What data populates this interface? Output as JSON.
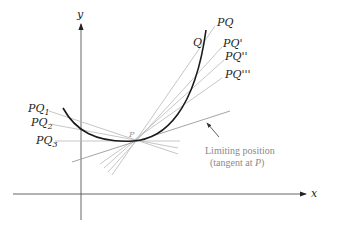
{
  "axes": {
    "x_label": "x",
    "y_label": "y"
  },
  "points": {
    "P": "P",
    "Q": "Q"
  },
  "secant_labels": {
    "pq": "PQ",
    "pq1": "PQ'",
    "pq2": "PQ''",
    "pq3": "PQ'''",
    "pq_sub1_base": "PQ",
    "pq_sub1": "1",
    "pq_sub2_base": "PQ",
    "pq_sub2": "2",
    "pq_sub3_base": "PQ",
    "pq_sub3": "3"
  },
  "annotation": {
    "line1": "Limiting position",
    "line2_prefix": "(tangent at ",
    "line2_point": "P",
    "line2_suffix": ")"
  },
  "colors": {
    "curve": "#1a1a1a",
    "secant": "#b5b5b5",
    "tangent": "#9a9a9a",
    "axis": "#555555",
    "annotation": "#8a8a8a"
  }
}
